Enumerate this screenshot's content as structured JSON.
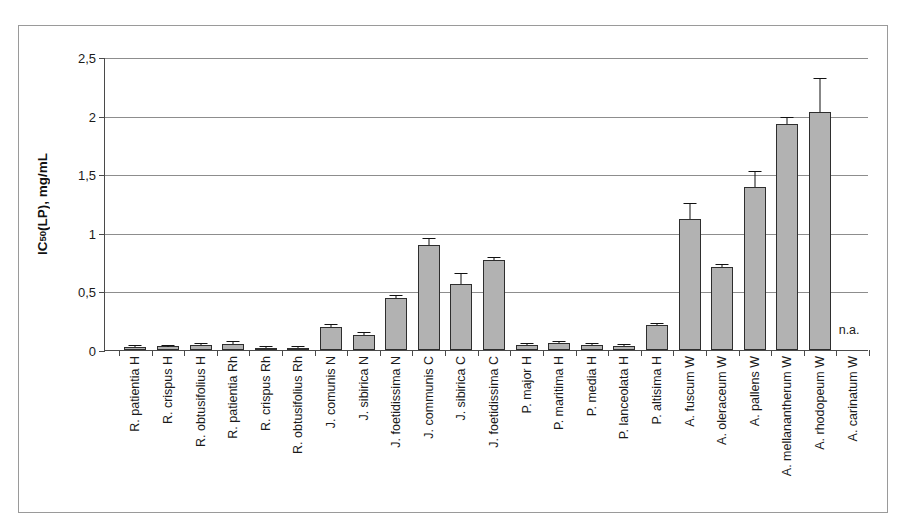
{
  "chart_data": {
    "type": "bar",
    "title": "",
    "xlabel": "",
    "ylabel": "IC50(LP), mg/mL",
    "ylabel_prefix": "IC",
    "ylabel_sub": "50",
    "ylabel_suffix": "(LP), mg/mL",
    "ylim": [
      0,
      2.5
    ],
    "ytick_labels": [
      "0",
      "0,5",
      "1",
      "1,5",
      "2",
      "2,5"
    ],
    "ytick_values": [
      0,
      0.5,
      1,
      1.5,
      2,
      2.5
    ],
    "grid": true,
    "legend": "none",
    "decimal_separator": ",",
    "categories": [
      "R. patientia H",
      "R. crispus H",
      "R. obtusifolius H",
      "R. patientia Rh",
      "R. crispus Rh",
      "R. obtusifolius Rh",
      "J. comunis N",
      "J. sibirica N",
      "J. foetidissima N",
      "J. communis C",
      "J. sibirica C",
      "J. foetidissima C",
      "P. major H",
      "P. maritima H",
      "P. media H",
      "P. lanceolata H",
      "P. altisima H",
      "A. fuscum W",
      "A. oleraceum W",
      "A. pallens W",
      "A. mellanantherum W",
      "A. rhodopeum W",
      "A. carinatum W"
    ],
    "values": [
      0.025,
      0.03,
      0.045,
      0.055,
      0.015,
      0.012,
      0.2,
      0.13,
      0.44,
      0.9,
      0.56,
      0.77,
      0.045,
      0.06,
      0.045,
      0.035,
      0.21,
      1.12,
      0.71,
      1.39,
      1.93,
      2.03,
      null
    ],
    "errors": [
      0.008,
      0.008,
      0.01,
      0.012,
      0.005,
      0.004,
      0.015,
      0.015,
      0.02,
      0.05,
      0.09,
      0.015,
      0.008,
      0.01,
      0.008,
      0.006,
      0.012,
      0.13,
      0.015,
      0.13,
      0.05,
      0.28,
      null
    ],
    "annotations": [
      {
        "text": "n.a.",
        "category": "A. carinatum W",
        "meaning": "not active"
      }
    ],
    "bar_color": "#b2b2b2",
    "bar_edge_color": "#2e2e2e",
    "error_color": "#111111",
    "grid_color": "#8d8d8d",
    "axis_color": "#4a4a4a",
    "frame_color": "#9a9a9a",
    "background": "#ffffff"
  }
}
